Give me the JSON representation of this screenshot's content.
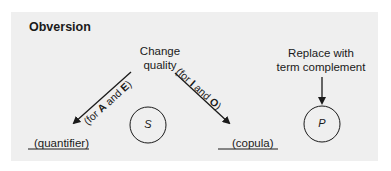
{
  "diagram": {
    "title": "Obversion",
    "change_quality": {
      "line1": "Change",
      "line2": "quality"
    },
    "left_branch": {
      "prefix": "(for ",
      "letter1": "A",
      "mid": " and ",
      "letter2": "E",
      "suffix": ")"
    },
    "right_branch": {
      "prefix": "(for ",
      "letter1": "I",
      "mid": " and ",
      "letter2": "O",
      "suffix": ")"
    },
    "replace": {
      "line1": "Replace with",
      "line2": "term complement"
    },
    "slots": {
      "quantifier": "(quantifier)",
      "subject": "S",
      "copula": "(copula)",
      "predicate": "P"
    },
    "colors": {
      "panel_bg": "#efefef",
      "ink": "#1a1a1a"
    }
  }
}
